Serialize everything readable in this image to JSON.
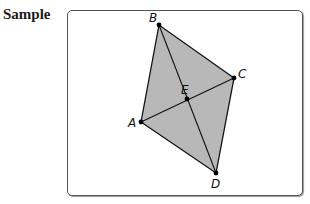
{
  "header": {
    "label": "Sample"
  },
  "diagram": {
    "shape": "quadrilateral ABDC with diagonals intersecting at E",
    "fill_color": "#b8b8b8",
    "stroke_color": "#111111",
    "points": {
      "A": {
        "label": "A",
        "x": 141,
        "y": 122
      },
      "B": {
        "label": "B",
        "x": 159,
        "y": 25
      },
      "C": {
        "label": "C",
        "x": 234,
        "y": 78
      },
      "D": {
        "label": "D",
        "x": 216,
        "y": 173
      },
      "E": {
        "label": "E",
        "x": 187,
        "y": 99
      }
    },
    "segments": [
      "AB",
      "BC",
      "CD",
      "DA",
      "AC",
      "BD"
    ]
  }
}
